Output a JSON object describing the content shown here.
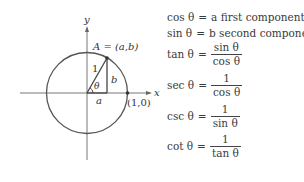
{
  "diagram": {
    "axis_labels": {
      "x": "x",
      "y": "y"
    },
    "point_A_label": "A = (a,b)",
    "hypotenuse_label": "1",
    "vertical_side_label": "b",
    "horizontal_side_label": "a",
    "angle_label": "θ",
    "point_on_x_label": "(1,0)"
  },
  "formulas": [
    {
      "lhs": "cos θ",
      "eq": "=",
      "rhs": "a first component"
    },
    {
      "lhs": "sin θ",
      "eq": "=",
      "rhs": "b second component"
    },
    {
      "lhs": "tan θ",
      "eq": "=",
      "num": "sin θ",
      "den": "cos θ"
    },
    {
      "lhs": "sec θ",
      "eq": "=",
      "num": "1",
      "den": "cos θ"
    },
    {
      "lhs": "csc θ",
      "eq": "=",
      "num": "1",
      "den": "sin θ"
    },
    {
      "lhs": "cot θ",
      "eq": "=",
      "num": "1",
      "den": "tan θ"
    }
  ]
}
